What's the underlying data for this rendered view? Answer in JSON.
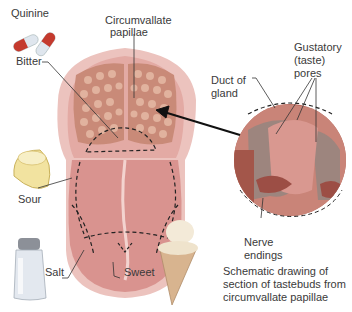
{
  "figure": {
    "labels": {
      "quinine": "Quinine",
      "circumvallate_line1": "Circumvallate",
      "circumvallate_line2": "papillae",
      "bitter": "Bitter",
      "gustatory_line1": "Gustatory",
      "gustatory_line2": "(taste)",
      "gustatory_line3": "pores",
      "duct_line1": "Duct of",
      "duct_line2": "gland",
      "sour": "Sour",
      "salt": "Salt",
      "sweet": "Sweet",
      "nerve_line1": "Nerve",
      "nerve_line2": "endings"
    },
    "caption": {
      "line1": "Schematic drawing of",
      "line2": "section of tastebuds from",
      "line3": "circumvallate papillae"
    },
    "icons": [
      "pill-capsules-icon",
      "lemon-icon",
      "salt-shaker-icon",
      "ice-cream-cone-icon"
    ],
    "colors": {
      "tongue": "#d9938f",
      "tongue_edge": "#e8b5b0",
      "papillae": "#c98a78",
      "inset_tissue": "#b86a5e",
      "arrow": "#111111"
    }
  }
}
